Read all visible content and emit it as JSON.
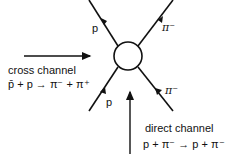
{
  "diagram": {
    "labels": {
      "top_left": "p",
      "top_right": "π⁻",
      "bottom_left": "p",
      "bottom_right": "π⁻"
    },
    "cross_channel": {
      "title": "cross channel",
      "reaction": "p̄ + p → π⁻ + π⁺"
    },
    "direct_channel": {
      "title": "direct channel",
      "reaction": "p + π⁻ → p + π⁻"
    }
  }
}
